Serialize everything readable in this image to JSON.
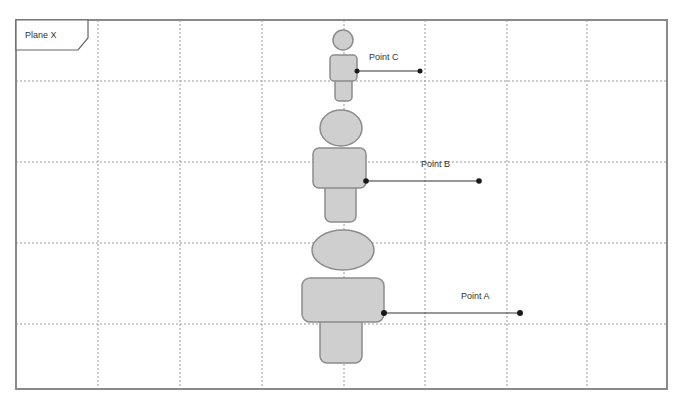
{
  "frame": {
    "label": "Plane X",
    "bounds": {
      "x": 16,
      "y": 20,
      "width": 651,
      "height": 369
    },
    "grid_x": [
      98,
      180,
      262,
      344,
      425,
      507,
      587
    ],
    "grid_y": [
      81,
      162,
      243,
      324
    ]
  },
  "figures": [
    {
      "id": "figure-c",
      "label": "Point C",
      "size": "small"
    },
    {
      "id": "figure-b",
      "label": "Point B",
      "size": "medium"
    },
    {
      "id": "figure-a",
      "label": "Point A",
      "size": "large"
    }
  ],
  "colors": {
    "shape_fill": "#cfcfcf",
    "shape_stroke": "#8c8c8c",
    "grid": "#9a9a9a",
    "arrow": "#333333"
  }
}
